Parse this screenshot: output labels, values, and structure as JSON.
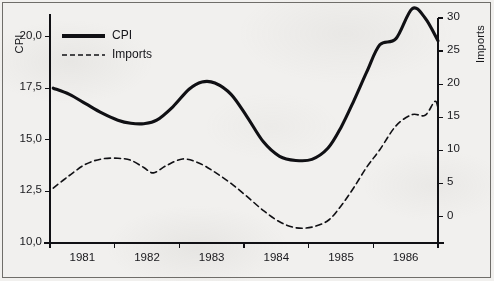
{
  "figure": {
    "background_color": "#f1f0ee",
    "border_color": "#6f6d69",
    "line_color": "#101014"
  },
  "legend": {
    "position": "top-left-inside",
    "entries": [
      {
        "label": "CPI",
        "style": "solid",
        "width": 3
      },
      {
        "label": "Imports",
        "style": "dashed",
        "width": 1.5
      }
    ]
  },
  "axes": {
    "left": {
      "title": "CPI",
      "ticks": [
        "10,0",
        "12,5",
        "15,0",
        "17,5",
        "20,0"
      ]
    },
    "right": {
      "title": "Imports",
      "ticks": [
        "0",
        "5",
        "10",
        "15",
        "20",
        "25",
        "30"
      ]
    },
    "bottom": {
      "ticks": [
        "1981",
        "1982",
        "1983",
        "1984",
        "1985",
        "1986"
      ]
    }
  },
  "chart_data": {
    "type": "line",
    "title": "",
    "xlabel": "",
    "ylabel": "CPI",
    "y2label": "Imports",
    "grid": false,
    "legend_position": "top-left-inside",
    "x_tick_labels": [
      "1981",
      "1982",
      "1983",
      "1984",
      "1985",
      "1986"
    ],
    "xlim": [
      1980.5,
      1986.5
    ],
    "ylim": [
      10.0,
      20.9
    ],
    "y2lim": [
      -4.0,
      30.0
    ],
    "y_ticks": [
      10.0,
      12.5,
      15.0,
      17.5,
      20.0
    ],
    "y_tick_labels": [
      "10,0",
      "12,5",
      "15,0",
      "17,5",
      "20,0"
    ],
    "y2_ticks": [
      0,
      5,
      10,
      15,
      20,
      25,
      30
    ],
    "y2_tick_labels": [
      "0",
      "5",
      "10",
      "15",
      "20",
      "25",
      "30"
    ],
    "series": [
      {
        "name": "CPI",
        "axis": "left",
        "style": "solid",
        "x": [
          1980.55,
          1980.8,
          1981.05,
          1981.3,
          1981.55,
          1981.75,
          1981.95,
          1982.15,
          1982.4,
          1982.65,
          1982.85,
          1983.05,
          1983.3,
          1983.55,
          1983.8,
          1984.05,
          1984.3,
          1984.55,
          1984.8,
          1985.0,
          1985.2,
          1985.4,
          1985.6,
          1985.85,
          1986.1,
          1986.3,
          1986.5
        ],
        "values": [
          17.5,
          17.2,
          16.75,
          16.3,
          15.95,
          15.8,
          15.78,
          15.95,
          16.6,
          17.45,
          17.8,
          17.75,
          17.2,
          16.1,
          14.9,
          14.2,
          14.0,
          14.05,
          14.6,
          15.6,
          16.9,
          18.3,
          19.6,
          19.9,
          21.35,
          20.9,
          19.8
        ]
      },
      {
        "name": "Imports",
        "axis": "right",
        "style": "dashed",
        "x": [
          1980.55,
          1980.8,
          1981.05,
          1981.3,
          1981.55,
          1981.75,
          1981.95,
          1982.1,
          1982.3,
          1982.55,
          1982.8,
          1983.05,
          1983.3,
          1983.55,
          1983.8,
          1984.05,
          1984.3,
          1984.55,
          1984.8,
          1985.0,
          1985.2,
          1985.4,
          1985.6,
          1985.85,
          1986.1,
          1986.3,
          1986.45,
          1986.5
        ],
        "values": [
          4.3,
          6.2,
          7.9,
          8.7,
          8.8,
          8.5,
          7.4,
          6.6,
          7.7,
          8.7,
          8.1,
          6.7,
          5.0,
          3.0,
          0.9,
          -0.8,
          -1.7,
          -1.6,
          -0.6,
          1.6,
          4.4,
          7.5,
          10.1,
          13.7,
          15.4,
          15.3,
          17.4,
          16.4
        ]
      }
    ]
  }
}
